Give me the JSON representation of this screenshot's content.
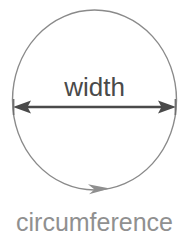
{
  "canvas": {
    "width": 189,
    "height": 237,
    "background": "#ffffff"
  },
  "diagram": {
    "shape": {
      "name": "circle",
      "stroke_color": "#8a8a8a",
      "stroke_width": 1.4,
      "fill": "none",
      "center_x": 94.5,
      "center_y": 100,
      "radius_x": 82,
      "radius_y": 90
    },
    "width_arrow": {
      "label": "width",
      "label_color": "#4a4a4a",
      "label_font_size": 26,
      "label_x": 94.5,
      "label_y": 96,
      "line_color": "#4a4a4a",
      "line_width": 2.2,
      "y": 107,
      "x_start": 13,
      "x_end": 176,
      "double_headed": true,
      "arrow_head_length": 17,
      "arrow_head_width": 13
    },
    "circumference_arrow": {
      "label": "circumference",
      "label_color": "#909090",
      "label_font_size": 25,
      "label_x": 94.5,
      "label_y": 231,
      "marker_color": "#8a8a8a",
      "marker_x": 104,
      "marker_y": 190,
      "direction": "clockwise"
    }
  }
}
